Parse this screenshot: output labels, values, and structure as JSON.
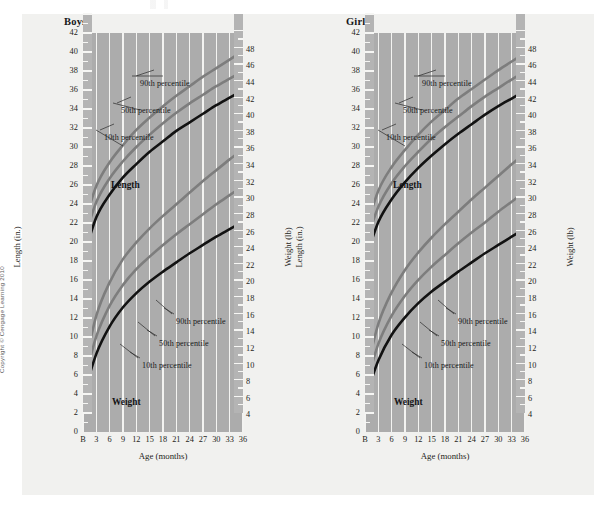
{
  "copyright": "Copyright © Cengage Learning 2010",
  "charts": [
    {
      "id": "boys",
      "title": "Boys",
      "left_axis_title": "Length (in.)",
      "right_axis_title": "Weight (lb)",
      "x_axis_title": "Age (months)",
      "group_labels": {
        "length": "Length",
        "weight": "Weight"
      },
      "annotations": {
        "length_90": "90th percentile",
        "length_50": "50th percentile",
        "length_10": "10th percentile",
        "weight_90": "90th percentile",
        "weight_50": "50th percentile",
        "weight_10": "10th percentile"
      }
    },
    {
      "id": "girls",
      "title": "Girls",
      "left_axis_title": "Length (in.)",
      "right_axis_title": "Weight (lb)",
      "x_axis_title": "Age (months)",
      "group_labels": {
        "length": "Length",
        "weight": "Weight"
      },
      "annotations": {
        "length_90": "90th percentile",
        "length_50": "50th percentile",
        "length_10": "10th percentile",
        "weight_90": "90th percentile",
        "weight_50": "50th percentile",
        "weight_10": "10th percentile"
      }
    }
  ],
  "axes": {
    "left_ticks": [
      42,
      40,
      38,
      36,
      34,
      32,
      30,
      28,
      26,
      24,
      22,
      20,
      18,
      16,
      14,
      12,
      10,
      8,
      6,
      4,
      2,
      0
    ],
    "right_ticks": [
      48,
      46,
      44,
      42,
      40,
      38,
      36,
      34,
      32,
      30,
      28,
      26,
      24,
      22,
      20,
      18,
      16,
      14,
      12,
      10,
      8,
      6,
      4
    ],
    "x_ticks": [
      "B",
      "3",
      "6",
      "9",
      "12",
      "15",
      "18",
      "21",
      "24",
      "27",
      "30",
      "33",
      "36"
    ],
    "left_range": [
      0,
      42
    ],
    "right_range": [
      2,
      50
    ],
    "x_range": [
      0,
      36
    ]
  },
  "colors": {
    "plot_background": "#acacac",
    "page_background": "#f1f1ef",
    "gridline": "#f3f3f1",
    "percentile_90": "#7d7d7d",
    "percentile_50": "#7d7d7d",
    "percentile_10": "#121212",
    "text": "#1b1b1b"
  },
  "chart_data": {
    "type": "line",
    "xlabel": "Age (months)",
    "ylabel": "Length (in.)",
    "y2label": "Weight (lb)",
    "ylim": [
      0,
      42
    ],
    "y2lim": [
      2,
      50
    ],
    "xlim": [
      0,
      36
    ],
    "grid": "vertical",
    "legend": "inline annotations",
    "x": [
      0,
      3,
      6,
      9,
      12,
      15,
      18,
      21,
      24,
      27,
      30,
      33,
      36
    ],
    "panels": [
      {
        "name": "Boys",
        "series": [
          {
            "name": "Length 90th percentile",
            "axis": "left",
            "unit": "in.",
            "color": "#7d7d7d",
            "values": [
              21.5,
              25.9,
              28.4,
              30.2,
              31.8,
              33.1,
              34.3,
              35.4,
              36.4,
              37.4,
              38.3,
              39.2,
              40.1
            ]
          },
          {
            "name": "Length 50th percentile",
            "axis": "left",
            "unit": "in.",
            "color": "#7d7d7d",
            "values": [
              19.9,
              24.2,
              26.7,
              28.5,
              30.0,
              31.3,
              32.5,
              33.6,
              34.6,
              35.5,
              36.4,
              37.2,
              38.0
            ]
          },
          {
            "name": "Length 10th percentile",
            "axis": "left",
            "unit": "in.",
            "color": "#121212",
            "values": [
              18.2,
              22.6,
              25.0,
              26.8,
              28.2,
              29.5,
              30.6,
              31.7,
              32.6,
              33.5,
              34.4,
              35.2,
              36.0
            ]
          },
          {
            "name": "Weight 90th percentile",
            "axis": "right",
            "unit": "lb",
            "color": "#7d7d7d",
            "values": [
              9.0,
              16.0,
              20.0,
              22.8,
              24.8,
              26.5,
              28.0,
              29.4,
              30.8,
              32.2,
              33.5,
              34.8,
              36.0
            ]
          },
          {
            "name": "Weight 50th percentile",
            "axis": "right",
            "unit": "lb",
            "color": "#7d7d7d",
            "values": [
              7.5,
              13.5,
              17.2,
              19.7,
              21.6,
              23.1,
              24.5,
              25.8,
              27.0,
              28.2,
              29.4,
              30.5,
              31.6
            ]
          },
          {
            "name": "Weight 10th percentile",
            "axis": "right",
            "unit": "lb",
            "color": "#121212",
            "values": [
              6.2,
              11.4,
              14.7,
              17.0,
              18.7,
              20.1,
              21.3,
              22.4,
              23.5,
              24.5,
              25.5,
              26.4,
              27.3
            ]
          }
        ]
      },
      {
        "name": "Girls",
        "series": [
          {
            "name": "Length 90th percentile",
            "axis": "left",
            "unit": "in.",
            "color": "#7d7d7d",
            "values": [
              21.1,
              25.4,
              27.9,
              29.7,
              31.3,
              32.7,
              33.9,
              35.1,
              36.1,
              37.1,
              38.1,
              39.0,
              39.9
            ]
          },
          {
            "name": "Length 50th percentile",
            "axis": "left",
            "unit": "in.",
            "color": "#7d7d7d",
            "values": [
              19.6,
              23.7,
              26.2,
              28.0,
              29.5,
              30.9,
              32.1,
              33.2,
              34.3,
              35.3,
              36.2,
              37.1,
              37.9
            ]
          },
          {
            "name": "Length 10th percentile",
            "axis": "left",
            "unit": "in.",
            "color": "#121212",
            "values": [
              18.0,
              22.1,
              24.5,
              26.3,
              27.8,
              29.1,
              30.3,
              31.4,
              32.4,
              33.4,
              34.3,
              35.1,
              35.9
            ]
          },
          {
            "name": "Weight 90th percentile",
            "axis": "right",
            "unit": "lb",
            "color": "#7d7d7d",
            "values": [
              8.6,
              15.0,
              18.8,
              21.5,
              23.6,
              25.4,
              27.0,
              28.5,
              30.0,
              31.4,
              32.8,
              34.2,
              35.5
            ]
          },
          {
            "name": "Weight 50th percentile",
            "axis": "right",
            "unit": "lb",
            "color": "#7d7d7d",
            "values": [
              7.2,
              12.6,
              16.0,
              18.4,
              20.3,
              21.9,
              23.3,
              24.7,
              26.0,
              27.2,
              28.5,
              29.7,
              30.9
            ]
          },
          {
            "name": "Weight 10th percentile",
            "axis": "right",
            "unit": "lb",
            "color": "#121212",
            "values": [
              6.0,
              10.6,
              13.7,
              15.8,
              17.5,
              18.9,
              20.1,
              21.3,
              22.4,
              23.5,
              24.5,
              25.5,
              26.5
            ]
          }
        ]
      }
    ]
  }
}
